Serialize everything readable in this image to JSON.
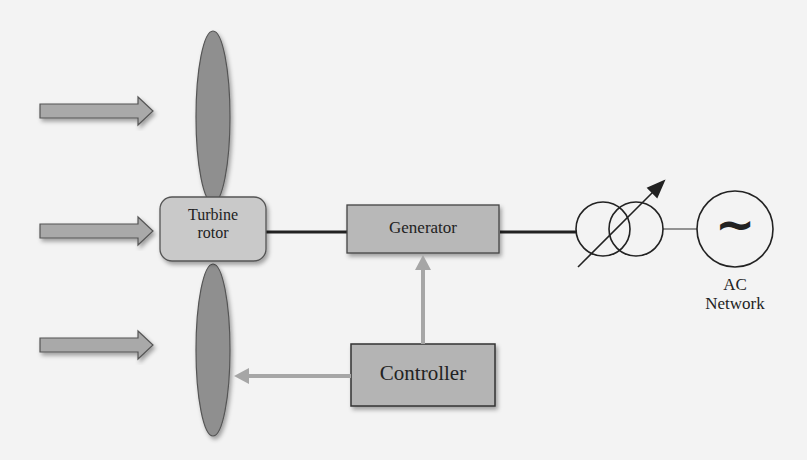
{
  "diagram": {
    "blocks": {
      "turbine_rotor": {
        "line1": "Turbine",
        "line2": "rotor"
      },
      "generator": {
        "label": "Generator"
      },
      "controller": {
        "label": "Controller"
      },
      "ac_network": {
        "line1": "AC",
        "line2": "Network",
        "symbol": "~"
      }
    },
    "wind_arrows": 3,
    "colors": {
      "background": "#f3f3f3",
      "block_fill": "#b8b8b8",
      "rotor_fill": "#c9c9c9",
      "blade_fill": "#8f8f8f",
      "control_arrow": "#a6a6a6",
      "line": "#222222"
    }
  }
}
